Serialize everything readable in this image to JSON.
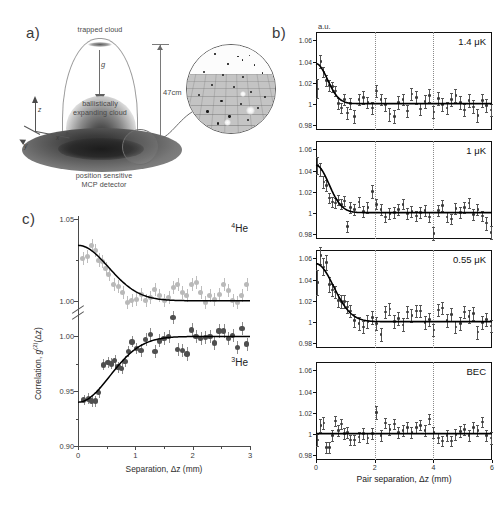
{
  "figure": {
    "panels": [
      {
        "letter": "a)"
      },
      {
        "letter": "b)"
      },
      {
        "letter": "c)"
      }
    ]
  },
  "panel_a": {
    "letter": "a)",
    "labels": {
      "trapped_cloud": "trapped cloud",
      "gravity": "g",
      "drop_distance": "47cm",
      "expanding_cloud": "ballistically\nexpanding cloud",
      "expanding_cloud_line1": "ballistically",
      "expanding_cloud_line2": "expanding cloud",
      "detector_line1": "position sensitive",
      "detector_line2": "MCP detector",
      "axis_z": "z",
      "axis_x": "x",
      "axis_y": "y"
    },
    "inset": {
      "name": "detector-surface-zoom",
      "description": "circular magnified view of MCP detector surface grid with single-atom detection events"
    }
  },
  "panel_b": {
    "letter": "b)",
    "units_label": "a.u.",
    "xlabel": "Pair separation, Δz (mm)",
    "xticks": [
      0,
      2,
      4,
      6
    ],
    "xlim": [
      0,
      6
    ],
    "ylim": [
      0.975,
      1.068
    ],
    "yticks": [
      "1.06",
      "1.04",
      "1.02",
      "1",
      "0.98"
    ],
    "ytick_values": [
      1.06,
      1.04,
      1.02,
      1.0,
      0.98
    ],
    "gridlines_x": [
      2,
      4
    ],
    "subplots": [
      {
        "label": "1.4 μK"
      },
      {
        "label": "1 μK"
      },
      {
        "label": "0.55 μK"
      },
      {
        "label": "BEC"
      }
    ]
  },
  "panel_c": {
    "letter": "c)",
    "xlabel": "Separation, Δz (mm)",
    "ylabel_prefix": "Correlation, ",
    "ylabel_symbol": "g",
    "ylabel_sup": "(2)",
    "ylabel_arg": "(Δz)",
    "xticks": [
      0,
      1,
      2,
      3
    ],
    "xlim": [
      0,
      3
    ],
    "yticks_upper": [
      "1.05",
      "1.00"
    ],
    "yticks_lower": [
      "1.00",
      "0.95",
      "0.90"
    ],
    "species_upper": {
      "mass": "4",
      "symbol": "He"
    },
    "species_lower": {
      "mass": "3",
      "symbol": "He"
    },
    "broken_axis": true
  },
  "chart_data": [
    {
      "type": "scatter",
      "name": "panel_b_1.4uK",
      "title": "1.4 μK",
      "xlabel": "Pair separation, Δz (mm)",
      "ylabel": "a.u.",
      "xlim": [
        0,
        6
      ],
      "ylim": [
        0.975,
        1.068
      ],
      "grid": true,
      "gridlines_x": [
        2,
        4
      ],
      "fit": {
        "type": "gaussian_plus_one",
        "amplitude": 0.038,
        "width_mm": 0.55,
        "baseline": 1.0
      },
      "x": [
        0.05,
        0.15,
        0.25,
        0.35,
        0.45,
        0.55,
        0.65,
        0.75,
        0.85,
        0.95,
        1.05,
        1.15,
        1.3,
        1.45,
        1.6,
        1.75,
        1.9,
        2.05,
        2.2,
        2.35,
        2.5,
        2.65,
        2.8,
        2.95,
        3.1,
        3.25,
        3.4,
        3.55,
        3.7,
        3.85,
        4.0,
        4.15,
        4.3,
        4.45,
        4.6,
        4.75,
        4.9,
        5.05,
        5.2,
        5.35,
        5.5,
        5.65,
        5.8,
        5.95
      ],
      "y": [
        1.014,
        1.04,
        1.03,
        1.022,
        1.017,
        1.016,
        1.012,
        1.0,
        0.996,
        1.004,
        0.991,
        1.0,
        0.988,
        1.004,
        1.006,
        1.001,
        0.996,
        1.012,
        1.004,
        0.999,
        0.99,
        0.988,
        1.001,
        1.004,
        0.993,
        1.009,
        1.006,
        0.995,
        1.002,
        1.008,
        0.992,
        1.005,
        0.999,
        0.996,
        1.004,
        1.008,
        1.001,
        0.994,
        1.003,
        0.997,
        0.989,
        1.003,
        0.998,
        0.994
      ],
      "yerr": [
        0.009,
        0.006,
        0.005,
        0.005,
        0.005,
        0.005,
        0.005,
        0.005,
        0.005,
        0.005,
        0.006,
        0.005,
        0.006,
        0.005,
        0.006,
        0.005,
        0.006,
        0.006,
        0.005,
        0.006,
        0.006,
        0.006,
        0.006,
        0.005,
        0.006,
        0.006,
        0.006,
        0.006,
        0.006,
        0.006,
        0.006,
        0.006,
        0.006,
        0.006,
        0.006,
        0.006,
        0.006,
        0.006,
        0.006,
        0.006,
        0.006,
        0.006,
        0.006,
        0.006
      ]
    },
    {
      "type": "scatter",
      "name": "panel_b_1uK",
      "title": "1 μK",
      "xlabel": "Pair separation, Δz (mm)",
      "ylabel": "a.u.",
      "xlim": [
        0,
        6
      ],
      "ylim": [
        0.975,
        1.068
      ],
      "grid": true,
      "gridlines_x": [
        2,
        4
      ],
      "fit": {
        "type": "gaussian_plus_one",
        "amplitude": 0.045,
        "width_mm": 0.62,
        "baseline": 1.0
      },
      "x": [
        0.05,
        0.15,
        0.25,
        0.35,
        0.45,
        0.55,
        0.65,
        0.75,
        0.85,
        0.95,
        1.05,
        1.15,
        1.3,
        1.45,
        1.6,
        1.75,
        1.9,
        2.05,
        2.2,
        2.35,
        2.5,
        2.65,
        2.8,
        2.95,
        3.1,
        3.25,
        3.4,
        3.55,
        3.7,
        3.85,
        4.0,
        4.15,
        4.3,
        4.45,
        4.6,
        4.75,
        4.9,
        5.05,
        5.2,
        5.35,
        5.5,
        5.65,
        5.8,
        5.95
      ],
      "y": [
        1.045,
        1.041,
        1.029,
        1.026,
        1.014,
        1.01,
        1.009,
        1.012,
        1.008,
        1.011,
        0.987,
        1.005,
        1.003,
        1.01,
        1.001,
        1.005,
        1.02,
        1.008,
        1.003,
        0.996,
        0.999,
        1.0,
        1.003,
        1.008,
        0.999,
        1.001,
        0.997,
        1.0,
        1.002,
        0.996,
        0.98,
        1.002,
        1.007,
        0.996,
        0.994,
        1.004,
        1.0,
        1.005,
        1.009,
        0.998,
        1.003,
        0.997,
        0.99,
        0.981
      ],
      "yerr": [
        0.008,
        0.006,
        0.006,
        0.005,
        0.005,
        0.005,
        0.005,
        0.005,
        0.005,
        0.005,
        0.005,
        0.005,
        0.005,
        0.005,
        0.005,
        0.005,
        0.006,
        0.005,
        0.005,
        0.005,
        0.005,
        0.005,
        0.005,
        0.005,
        0.005,
        0.005,
        0.005,
        0.005,
        0.005,
        0.005,
        0.006,
        0.005,
        0.005,
        0.005,
        0.005,
        0.005,
        0.005,
        0.005,
        0.005,
        0.005,
        0.005,
        0.005,
        0.006,
        0.006
      ]
    },
    {
      "type": "scatter",
      "name": "panel_b_0.55uK",
      "title": "0.55 μK",
      "xlabel": "Pair separation, Δz (mm)",
      "ylabel": "a.u.",
      "xlim": [
        0,
        6
      ],
      "ylim": [
        0.975,
        1.068
      ],
      "grid": true,
      "gridlines_x": [
        2,
        4
      ],
      "fit": {
        "type": "gaussian_plus_one",
        "amplitude": 0.055,
        "width_mm": 0.85,
        "baseline": 1.0
      },
      "x": [
        0.05,
        0.15,
        0.25,
        0.35,
        0.45,
        0.55,
        0.65,
        0.75,
        0.85,
        0.95,
        1.05,
        1.15,
        1.3,
        1.45,
        1.6,
        1.75,
        1.9,
        2.05,
        2.2,
        2.35,
        2.5,
        2.65,
        2.8,
        2.95,
        3.1,
        3.25,
        3.4,
        3.55,
        3.7,
        3.85,
        4.0,
        4.15,
        4.3,
        4.45,
        4.6,
        4.75,
        4.9,
        5.05,
        5.2,
        5.35,
        5.5,
        5.65,
        5.8,
        5.95
      ],
      "y": [
        1.037,
        1.063,
        1.052,
        1.056,
        1.035,
        1.03,
        1.028,
        1.02,
        1.019,
        1.019,
        1.014,
        1.01,
        1.001,
        0.998,
        0.995,
        1.0,
        1.004,
        0.998,
        0.988,
        1.009,
        1.012,
        1.0,
        1.003,
        0.997,
        1.009,
        1.006,
        1.01,
        1.01,
        0.999,
        1.002,
        0.992,
        1.011,
        1.013,
        1.001,
        1.007,
        0.995,
        0.998,
        1.009,
        1.005,
        1.008,
        0.99,
        0.999,
        1.002,
        0.996
      ],
      "yerr": [
        0.012,
        0.008,
        0.008,
        0.007,
        0.007,
        0.006,
        0.006,
        0.006,
        0.006,
        0.006,
        0.006,
        0.006,
        0.006,
        0.006,
        0.006,
        0.006,
        0.006,
        0.006,
        0.006,
        0.006,
        0.006,
        0.006,
        0.006,
        0.006,
        0.006,
        0.006,
        0.006,
        0.006,
        0.006,
        0.006,
        0.006,
        0.006,
        0.006,
        0.006,
        0.006,
        0.006,
        0.006,
        0.006,
        0.006,
        0.006,
        0.006,
        0.006,
        0.006,
        0.006
      ]
    },
    {
      "type": "scatter",
      "name": "panel_b_BEC",
      "title": "BEC",
      "xlabel": "Pair separation, Δz (mm)",
      "ylabel": "a.u.",
      "xlim": [
        0,
        6
      ],
      "ylim": [
        0.975,
        1.068
      ],
      "grid": true,
      "gridlines_x": [
        2,
        4
      ],
      "fit": {
        "type": "constant",
        "baseline": 1.0
      },
      "x": [
        0.05,
        0.15,
        0.25,
        0.35,
        0.45,
        0.55,
        0.65,
        0.75,
        0.85,
        0.95,
        1.05,
        1.15,
        1.3,
        1.45,
        1.6,
        1.75,
        1.9,
        2.05,
        2.2,
        2.35,
        2.5,
        2.65,
        2.8,
        2.95,
        3.1,
        3.25,
        3.4,
        3.55,
        3.7,
        3.85,
        4.0,
        4.15,
        4.3,
        4.45,
        4.6,
        4.75,
        4.9,
        5.05,
        5.2,
        5.35,
        5.5,
        5.65,
        5.8,
        5.95
      ],
      "y": [
        0.994,
        1.008,
        1.01,
        0.987,
        0.987,
        0.998,
        1.012,
        1.003,
        1.009,
        1.0,
        1.001,
        0.994,
        0.994,
        0.997,
        1.0,
        0.996,
        1.0,
        1.02,
        0.998,
        1.01,
        1.004,
        1.009,
        1.001,
        1.003,
        1.006,
        1.001,
        1.006,
        1.008,
        1.003,
        1.014,
        1.001,
        0.996,
        0.993,
        0.998,
        0.993,
        0.999,
        1.002,
        1.004,
        0.998,
        1.006,
        1.003,
        1.011,
        0.998,
        0.996
      ],
      "yerr": [
        0.006,
        0.006,
        0.006,
        0.005,
        0.005,
        0.005,
        0.005,
        0.005,
        0.005,
        0.005,
        0.005,
        0.005,
        0.005,
        0.005,
        0.005,
        0.005,
        0.005,
        0.006,
        0.005,
        0.005,
        0.005,
        0.005,
        0.005,
        0.005,
        0.005,
        0.005,
        0.005,
        0.005,
        0.005,
        0.005,
        0.005,
        0.005,
        0.005,
        0.005,
        0.005,
        0.005,
        0.005,
        0.005,
        0.005,
        0.005,
        0.005,
        0.005,
        0.005,
        0.006
      ]
    },
    {
      "type": "scatter",
      "name": "panel_c_He4",
      "title": "4He bunching",
      "xlabel": "Separation, Δz (mm)",
      "ylabel": "Correlation, g(2)(Δz)",
      "xlim": [
        0,
        3
      ],
      "ylim": [
        0.998,
        1.052
      ],
      "fit": {
        "type": "gaussian_plus_one",
        "amplitude": 0.034,
        "width_mm": 0.75,
        "baseline": 1.0
      },
      "x": [
        0.08,
        0.16,
        0.24,
        0.3,
        0.36,
        0.42,
        0.48,
        0.54,
        0.62,
        0.7,
        0.78,
        0.86,
        0.94,
        1.02,
        1.1,
        1.18,
        1.26,
        1.34,
        1.42,
        1.5,
        1.58,
        1.66,
        1.74,
        1.82,
        1.9,
        1.98,
        2.06,
        2.14,
        2.22,
        2.3,
        2.38,
        2.46,
        2.54,
        2.62,
        2.7,
        2.78,
        2.86,
        2.94
      ],
      "y": [
        1.026,
        1.027,
        1.034,
        1.031,
        1.025,
        1.024,
        1.02,
        1.016,
        1.01,
        1.009,
        1.005,
        0.999,
        1.0,
        1.001,
        1.004,
        1.0,
        1.002,
        1.007,
        1.003,
        1.0,
        1.002,
        1.008,
        1.01,
        1.005,
        1.003,
        1.01,
        1.011,
        1.005,
        0.999,
        1.003,
        1.001,
        1.004,
        1.01,
        1.006,
        1.0,
        0.999,
        1.003,
        1.01
      ],
      "yerr": [
        0.004,
        0.004,
        0.004,
        0.004,
        0.004,
        0.004,
        0.004,
        0.004,
        0.004,
        0.004,
        0.004,
        0.004,
        0.004,
        0.004,
        0.004,
        0.004,
        0.004,
        0.004,
        0.004,
        0.004,
        0.004,
        0.004,
        0.004,
        0.004,
        0.004,
        0.004,
        0.004,
        0.004,
        0.004,
        0.004,
        0.004,
        0.004,
        0.004,
        0.004,
        0.004,
        0.004,
        0.004,
        0.004
      ],
      "marker": "light-gray-circle"
    },
    {
      "type": "scatter",
      "name": "panel_c_He3",
      "title": "3He antibunching",
      "xlabel": "Separation, Δz (mm)",
      "ylabel": "Correlation, g(2)(Δz)",
      "xlim": [
        0,
        3
      ],
      "ylim": [
        0.9,
        1.015
      ],
      "fit": {
        "type": "inverted_gaussian_plus_one",
        "depth": 0.06,
        "width_mm": 0.78,
        "baseline": 1.0
      },
      "x": [
        0.1,
        0.18,
        0.24,
        0.3,
        0.36,
        0.44,
        0.52,
        0.58,
        0.64,
        0.7,
        0.76,
        0.82,
        0.88,
        0.94,
        1.02,
        1.1,
        1.18,
        1.26,
        1.34,
        1.42,
        1.5,
        1.58,
        1.66,
        1.74,
        1.82,
        1.9,
        1.98,
        2.06,
        2.14,
        2.22,
        2.3,
        2.38,
        2.46,
        2.54,
        2.62,
        2.7,
        2.78,
        2.86,
        2.94
      ],
      "y": [
        0.942,
        0.943,
        0.941,
        0.941,
        0.949,
        0.974,
        0.976,
        0.975,
        0.978,
        0.972,
        0.971,
        0.977,
        0.986,
        0.995,
        0.989,
        0.987,
        0.997,
        1.002,
        0.986,
        0.996,
        0.998,
        1.0,
        1.017,
        0.988,
        0.987,
        0.984,
        1.006,
        1.0,
        0.998,
        0.999,
        1.0,
        0.994,
        1.005,
        1.005,
        0.998,
        1.001,
        0.99,
        1.007,
        0.993
      ],
      "yerr": [
        0.005,
        0.005,
        0.005,
        0.005,
        0.005,
        0.005,
        0.005,
        0.005,
        0.005,
        0.005,
        0.005,
        0.005,
        0.005,
        0.005,
        0.005,
        0.006,
        0.006,
        0.006,
        0.006,
        0.006,
        0.006,
        0.006,
        0.006,
        0.006,
        0.006,
        0.006,
        0.006,
        0.006,
        0.006,
        0.006,
        0.006,
        0.006,
        0.006,
        0.006,
        0.006,
        0.006,
        0.006,
        0.006,
        0.006
      ],
      "marker": "dark-gray-circle"
    }
  ]
}
